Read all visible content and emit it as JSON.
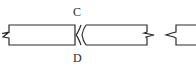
{
  "diagram": {
    "labels": {
      "top": "C",
      "bottom": "D"
    },
    "colors": {
      "stroke": "#2a2a2a",
      "background": "#ffffff"
    }
  }
}
